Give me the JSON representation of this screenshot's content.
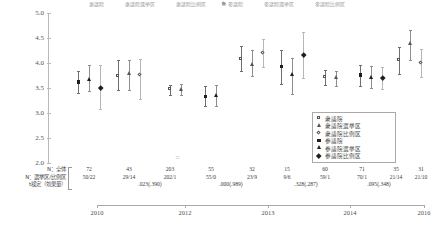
{
  "chart_data": {
    "type": "scatter",
    "title": "",
    "xlabel": "",
    "ylabel": "",
    "ylim": [
      2.0,
      5.0
    ],
    "ytick_labels": [
      "5.0",
      "4.5",
      "4.0",
      "3.5",
      "3.0",
      "2.5",
      "2.0"
    ],
    "ytick_values": [
      5.0,
      4.5,
      4.0,
      3.5,
      3.0,
      2.5,
      2.0
    ],
    "xtick_labels": [
      "2010",
      "2012",
      "2013",
      "2014",
      "2016"
    ],
    "grid": false,
    "legend_position": "bottom-right",
    "series": [
      {
        "name": "衆議院",
        "marker": "square-open",
        "values": []
      },
      {
        "name": "衆議院選挙区",
        "marker": "triangle-open",
        "values": []
      },
      {
        "name": "衆議院比例区",
        "marker": "diamond-open",
        "values": []
      },
      {
        "name": "参議院",
        "marker": "square-filled",
        "values": []
      },
      {
        "name": "参議院選挙区",
        "marker": "triangle-filled",
        "values": []
      },
      {
        "name": "参議院比例区",
        "marker": "diamond-filled",
        "values": []
      }
    ],
    "points": [
      {
        "group": "2010",
        "series": "参議院",
        "x": 78,
        "mean": 3.62,
        "low": 3.4,
        "high": 3.85
      },
      {
        "group": "2010",
        "series": "参議院選挙区",
        "x": 89,
        "mean": 3.66,
        "low": 3.44,
        "high": 3.96
      },
      {
        "group": "2010",
        "series": "参議院比例区",
        "x": 100,
        "mean": 3.5,
        "low": 3.08,
        "high": 3.97
      },
      {
        "group": "2012",
        "series": "衆議院",
        "x": 118,
        "mean": 3.74,
        "low": 3.46,
        "high": 4.06
      },
      {
        "group": "2012",
        "series": "衆議院選挙区",
        "x": 129,
        "mean": 3.78,
        "low": 3.46,
        "high": 4.07
      },
      {
        "group": "2012",
        "series": "衆議院比例区",
        "x": 140,
        "mean": 3.76,
        "low": 3.28,
        "high": 4.08
      },
      {
        "group": "2012b",
        "series": "衆議院",
        "x": 170,
        "mean": 3.47,
        "low": 3.37,
        "high": 3.57
      },
      {
        "group": "2012b",
        "series": "衆議院選挙区",
        "x": 181,
        "mean": 3.47,
        "low": 3.36,
        "high": 3.58
      },
      {
        "group": "2013",
        "series": "参議院",
        "x": 205,
        "mean": 3.33,
        "low": 3.15,
        "high": 3.54
      },
      {
        "group": "2013",
        "series": "参議院選挙区",
        "x": 216,
        "mean": 3.35,
        "low": 3.14,
        "high": 3.57
      },
      {
        "group": "2013b",
        "series": "衆議院",
        "x": 241,
        "mean": 4.08,
        "low": 3.84,
        "high": 4.35
      },
      {
        "group": "2013b",
        "series": "衆議院選挙区",
        "x": 252,
        "mean": 3.97,
        "low": 3.74,
        "high": 4.26
      },
      {
        "group": "2013b",
        "series": "衆議院比例区",
        "x": 263,
        "mean": 4.2,
        "low": 3.93,
        "high": 4.48
      },
      {
        "group": "2014",
        "series": "参議院",
        "x": 281,
        "mean": 3.93,
        "low": 3.58,
        "high": 4.27
      },
      {
        "group": "2014",
        "series": "参議院選挙区",
        "x": 292,
        "mean": 3.76,
        "low": 3.38,
        "high": 4.1
      },
      {
        "group": "2014",
        "series": "参議院比例区",
        "x": 303,
        "mean": 4.17,
        "low": 3.7,
        "high": 4.62
      },
      {
        "group": "2014b",
        "series": "衆議院",
        "x": 325,
        "mean": 3.71,
        "low": 3.57,
        "high": 3.86
      },
      {
        "group": "2014b",
        "series": "衆議院選挙区",
        "x": 336,
        "mean": 3.7,
        "low": 3.55,
        "high": 3.85
      },
      {
        "group": "2016",
        "series": "参議院",
        "x": 360,
        "mean": 3.76,
        "low": 3.54,
        "high": 3.97
      },
      {
        "group": "2016",
        "series": "参議院選挙区",
        "x": 371,
        "mean": 3.71,
        "low": 3.5,
        "high": 3.94
      },
      {
        "group": "2016",
        "series": "参議院比例区",
        "x": 382,
        "mean": 3.7,
        "low": 3.48,
        "high": 3.92
      },
      {
        "group": "2016b",
        "series": "衆議院",
        "x": 399,
        "mean": 4.05,
        "low": 3.78,
        "high": 4.32
      },
      {
        "group": "2016b",
        "series": "衆議院選挙区",
        "x": 410,
        "mean": 4.38,
        "low": 4.07,
        "high": 4.66
      },
      {
        "group": "2016b",
        "series": "衆議院比例区",
        "x": 421,
        "mean": 4.0,
        "low": 3.72,
        "high": 4.28
      }
    ]
  },
  "axis": {
    "y_labels": [
      "5.0",
      "4.5",
      "4.0",
      "3.5",
      "3.0",
      "2.5",
      "2.0"
    ],
    "x_labels": [
      "2010",
      "2012",
      "2013",
      "2014",
      "2016"
    ]
  },
  "legend": {
    "items": [
      {
        "label": "衆議院",
        "marker": "square-open-icon"
      },
      {
        "label": "衆議院選挙区",
        "marker": "triangle-open-icon"
      },
      {
        "label": "衆議院比例区",
        "marker": "diamond-open-icon"
      },
      {
        "label": "参議院",
        "marker": "square-filled-icon"
      },
      {
        "label": "参議院選挙区",
        "marker": "triangle-filled-icon"
      },
      {
        "label": "参議院比例区",
        "marker": "diamond-filled-icon"
      }
    ]
  },
  "top_legend": {
    "items": [
      {
        "label": "衆議院"
      },
      {
        "label": "衆議院選挙区"
      },
      {
        "label": "衆議院比例区"
      },
      {
        "label": "参議院"
      },
      {
        "label": "参議院選挙区"
      },
      {
        "label": "参議院比例区"
      }
    ]
  },
  "footer": {
    "row_labels": {
      "total": "N：全体",
      "split": "N：選挙区/比例区",
      "test": "t検定（効果量）"
    },
    "columns": [
      {
        "x": 89,
        "total": "72",
        "split": "50/22"
      },
      {
        "x": 129,
        "total": "43",
        "split": "29/14"
      },
      {
        "x": 170,
        "total": "203",
        "split": "202/1"
      },
      {
        "x": 211,
        "total": "55",
        "split": "55/0"
      },
      {
        "x": 252,
        "total": "32",
        "split": "23/9"
      },
      {
        "x": 287,
        "total": "15",
        "split": "9/6"
      },
      {
        "x": 325,
        "total": "60",
        "split": "59/1"
      },
      {
        "x": 362,
        "total": "71",
        "split": "70/1"
      },
      {
        "x": 396,
        "total": "35",
        "split": "21/14"
      },
      {
        "x": 421,
        "total": "31",
        "split": "21/10"
      }
    ],
    "tests": [
      {
        "x": 150,
        "value": ".023(.390)"
      },
      {
        "x": 231,
        "value": ".000(.989)"
      },
      {
        "x": 306,
        "value": ".328(.287)"
      },
      {
        "x": 379,
        "value": ".095(.348)"
      }
    ]
  },
  "colors": {
    "axis": "#b9b9b9",
    "filled_marker": "#1e1e1e",
    "open_marker": "#555555",
    "error_bar": "#6f6f6f",
    "error_bar_light": "#b6b6b6",
    "text": "#3a3a3a",
    "background": "#ffffff"
  }
}
